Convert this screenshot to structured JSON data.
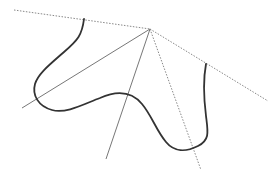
{
  "diagram": {
    "apex": [
      150,
      29
    ],
    "colors": {
      "background": "#ffffff",
      "curve": "#333333",
      "solid_line": "#777777",
      "dotted_line": "#888888"
    },
    "lines": [
      {
        "id": "dotted-left-ray",
        "style": "dotted",
        "from": [
          14,
          10
        ],
        "to": [
          150,
          29
        ]
      },
      {
        "id": "dotted-right-ray",
        "style": "dotted",
        "from": [
          150,
          29
        ],
        "to": [
          268,
          101
        ]
      },
      {
        "id": "solid-left-ray",
        "style": "solid",
        "from": [
          150,
          29
        ],
        "to": [
          22,
          108
        ]
      },
      {
        "id": "solid-down-ray",
        "style": "solid",
        "from": [
          150,
          29
        ],
        "to": [
          106,
          159
        ]
      },
      {
        "id": "dotted-down-ray",
        "style": "dotted",
        "from": [
          150,
          29
        ],
        "to": [
          201,
          170
        ]
      }
    ],
    "curve": {
      "id": "boundary-curve",
      "path": "M84,19 C82,35 78,40 64,52 C48,66 38,74 35,84 C32,95 38,106 52,110 C66,114 84,104 100,98 C118,90 132,92 142,104 C152,116 156,130 166,142 C174,152 186,152 198,146 C210,140 208,132 206,116 C204,100 203,80 206,64"
    }
  }
}
